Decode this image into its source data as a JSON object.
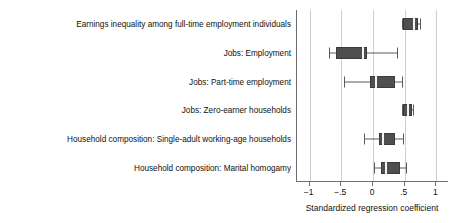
{
  "chart_data": {
    "type": "box",
    "title": "",
    "xlabel": "Standardized regression coefficient",
    "ylabel": "",
    "xlim": [
      -1.2,
      1.2
    ],
    "xticks": [
      -1,
      -0.5,
      0,
      0.5,
      1
    ],
    "xticklabels": [
      "−1",
      "−.5",
      "0",
      ".5",
      "1"
    ],
    "grid": "vertical",
    "legend": "none",
    "orientation": "horizontal",
    "categories": [
      "Earnings inequality among full-time employment individuals",
      "Jobs: Employment",
      "Jobs: Part-time employment",
      "Jobs: Zero-earner households",
      "Household composition: Single-adult working-age households",
      "Household composition: Marital homogamy"
    ],
    "boxes": [
      {
        "category": "Earnings inequality among full-time employment individuals",
        "whisker_low": 0.45,
        "q1": 0.48,
        "median": 0.64,
        "q3": 0.71,
        "whisker_high": 0.74
      },
      {
        "category": "Jobs: Employment",
        "whisker_low": -0.7,
        "q1": -0.59,
        "median": -0.16,
        "q3": -0.09,
        "whisker_high": 0.38
      },
      {
        "category": "Jobs: Part-time employment",
        "whisker_low": -0.46,
        "q1": -0.04,
        "median": 0.04,
        "q3": 0.34,
        "whisker_high": 0.46
      },
      {
        "category": "Jobs: Zero-earner households",
        "whisker_low": 0.46,
        "q1": 0.48,
        "median": 0.55,
        "q3": 0.61,
        "whisker_high": 0.63
      },
      {
        "category": "Household composition: Single-adult working-age households",
        "whisker_low": -0.14,
        "q1": 0.09,
        "median": 0.16,
        "q3": 0.34,
        "whisker_high": 0.48
      },
      {
        "category": "Household composition: Marital homogamy",
        "whisker_low": 0.02,
        "q1": 0.13,
        "median": 0.2,
        "q3": 0.43,
        "whisker_high": 0.52
      }
    ],
    "colors": {
      "box_fill": "#4f4f4f",
      "box_edge": "#3a3a3a",
      "median": "#f2f2f2",
      "whisker": "#5b5b5b",
      "grid": "#cfcfcf",
      "axis": "#6e6e6e",
      "text": "#111111",
      "background": "#ffffff"
    }
  },
  "axis": {
    "x_title": "Standardized regression coefficient"
  }
}
